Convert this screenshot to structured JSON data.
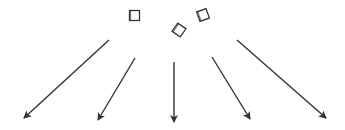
{
  "diagram": {
    "stroke_color": "#333333",
    "background": "#ffffff",
    "squares": [
      {
        "cx": 134.5,
        "cy": 15.5,
        "size": 10,
        "rotation": 0
      },
      {
        "cx": 179,
        "cy": 30,
        "size": 10,
        "rotation": 35
      },
      {
        "cx": 203,
        "cy": 15,
        "size": 10,
        "rotation": -20
      }
    ],
    "arrows": [
      {
        "x1": 109,
        "y1": 40,
        "x2": 24,
        "y2": 118
      },
      {
        "x1": 135,
        "y1": 58,
        "x2": 98,
        "y2": 120
      },
      {
        "x1": 174,
        "y1": 62,
        "x2": 174,
        "y2": 122
      },
      {
        "x1": 212,
        "y1": 57,
        "x2": 250,
        "y2": 119
      },
      {
        "x1": 237,
        "y1": 40,
        "x2": 326,
        "y2": 118
      }
    ]
  }
}
